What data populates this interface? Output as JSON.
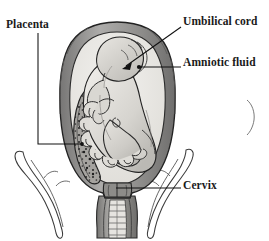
{
  "figure": {
    "background_color": "#ffffff",
    "line_color": "#1a1a1a",
    "text_color": "#1a1a1a"
  },
  "labels": [
    {
      "id": "placenta",
      "text": "Placenta",
      "position": "top-left",
      "leader": "vertical then horizontal-right to speckled placental wall"
    },
    {
      "id": "umbilical_cord",
      "text": "Umbilical cord",
      "position": "top-right",
      "leader": "diagonal arrow pointing down-left into the amniotic cavity"
    },
    {
      "id": "amniotic_fluid",
      "text": "Amniotic fluid",
      "position": "middle-right",
      "leader": "horizontal line ending in a dot inside the cavity"
    },
    {
      "id": "cervix",
      "text": "Cervix",
      "position": "lower-right",
      "leader": "horizontal line to the uterine neck"
    }
  ],
  "structures": {
    "uterus_wall": {
      "name": "Uterine wall",
      "fill": "#9a9a9a",
      "stroke": "#2b2b2b"
    },
    "amniotic_cavity": {
      "name": "Amniotic cavity",
      "fill": "#e8e6e2"
    },
    "placenta": {
      "name": "Placenta",
      "fill": "#9c9a96",
      "speckled": true
    },
    "fetus": {
      "name": "Fetus",
      "fill": "#cfcdc8",
      "stroke": "#2b2b2b"
    },
    "cord": {
      "name": "Umbilical cord",
      "fill": "#d8d6d1"
    },
    "pelvis_left": {
      "name": "Left pelvic bone outline",
      "fill": "none"
    },
    "pelvis_right": {
      "name": "Right pelvic bone outline",
      "fill": "none"
    },
    "vagina": {
      "name": "Vaginal canal",
      "fill": "#a8a6a2"
    }
  }
}
